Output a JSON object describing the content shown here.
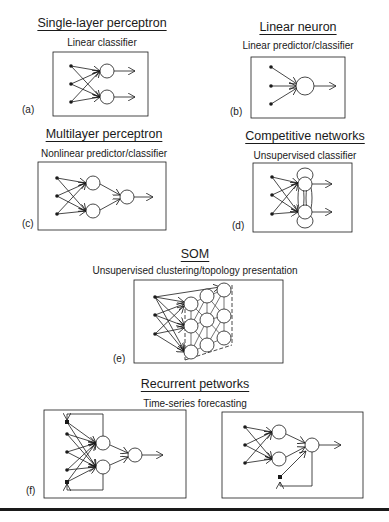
{
  "panels": {
    "a": {
      "label": "(a)",
      "title": "Single-layer perceptron",
      "subtitle": "Linear classifier"
    },
    "b": {
      "label": "(b)",
      "title": "Linear neuron",
      "subtitle": "Linear predictor/classifier"
    },
    "c": {
      "label": "(c)",
      "title": "Multilayer perceptron",
      "subtitle": "Nonlinear predictor/classifier"
    },
    "d": {
      "label": "(d)",
      "title": "Competitive networks",
      "subtitle": "Unsupervised classifier"
    },
    "e": {
      "label": "(e)",
      "title": "SOM",
      "subtitle": "Unsupervised clustering/topology presentation"
    },
    "f": {
      "label": "(f)",
      "title": "Recurrent petworks",
      "subtitle": "Time-series forecasting"
    }
  },
  "colors": {
    "ink": "#1a1a1a",
    "background": "#ffffff"
  }
}
